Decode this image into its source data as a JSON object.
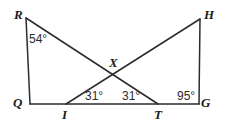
{
  "figure": {
    "type": "geometry-diagram",
    "background_color": "#ffffff",
    "stroke_color": "#2b2b2b",
    "label_color": "#1b1b1b",
    "width": 227,
    "height": 125
  },
  "points": {
    "R": {
      "label": "R",
      "x": 26,
      "y": 18,
      "label_x": 14,
      "label_y": 8
    },
    "H": {
      "label": "H",
      "x": 200,
      "y": 19,
      "label_x": 204,
      "label_y": 8
    },
    "Q": {
      "label": "Q",
      "x": 30,
      "y": 104,
      "label_x": 13,
      "label_y": 96
    },
    "G": {
      "label": "G",
      "x": 199,
      "y": 104,
      "label_x": 201,
      "label_y": 96
    },
    "I": {
      "label": "I",
      "x": 66,
      "y": 104,
      "label_x": 62,
      "label_y": 108
    },
    "T": {
      "label": "T",
      "x": 158,
      "y": 104,
      "label_x": 154,
      "label_y": 108
    },
    "X": {
      "label": "X",
      "x": 114,
      "y": 73,
      "label_x": 109,
      "label_y": 56
    }
  },
  "segments": [
    {
      "name": "segment-R-Q",
      "from": "R",
      "to": "Q"
    },
    {
      "name": "segment-R-T",
      "from": "R",
      "to": "T"
    },
    {
      "name": "segment-I-H",
      "from": "I",
      "to": "H"
    },
    {
      "name": "segment-H-G",
      "from": "H",
      "to": "G"
    },
    {
      "name": "segment-Q-G",
      "from": "Q",
      "to": "G"
    }
  ],
  "angles": [
    {
      "name": "angle-at-R",
      "vertex": "R",
      "text": "54°",
      "x": 29,
      "y": 33
    },
    {
      "name": "angle-at-I",
      "vertex": "I",
      "text": "31°",
      "x": 85,
      "y": 90
    },
    {
      "name": "angle-at-T",
      "vertex": "T",
      "text": "31°",
      "x": 122,
      "y": 90
    },
    {
      "name": "angle-at-G",
      "vertex": "G",
      "text": "95°",
      "x": 177,
      "y": 90
    }
  ]
}
